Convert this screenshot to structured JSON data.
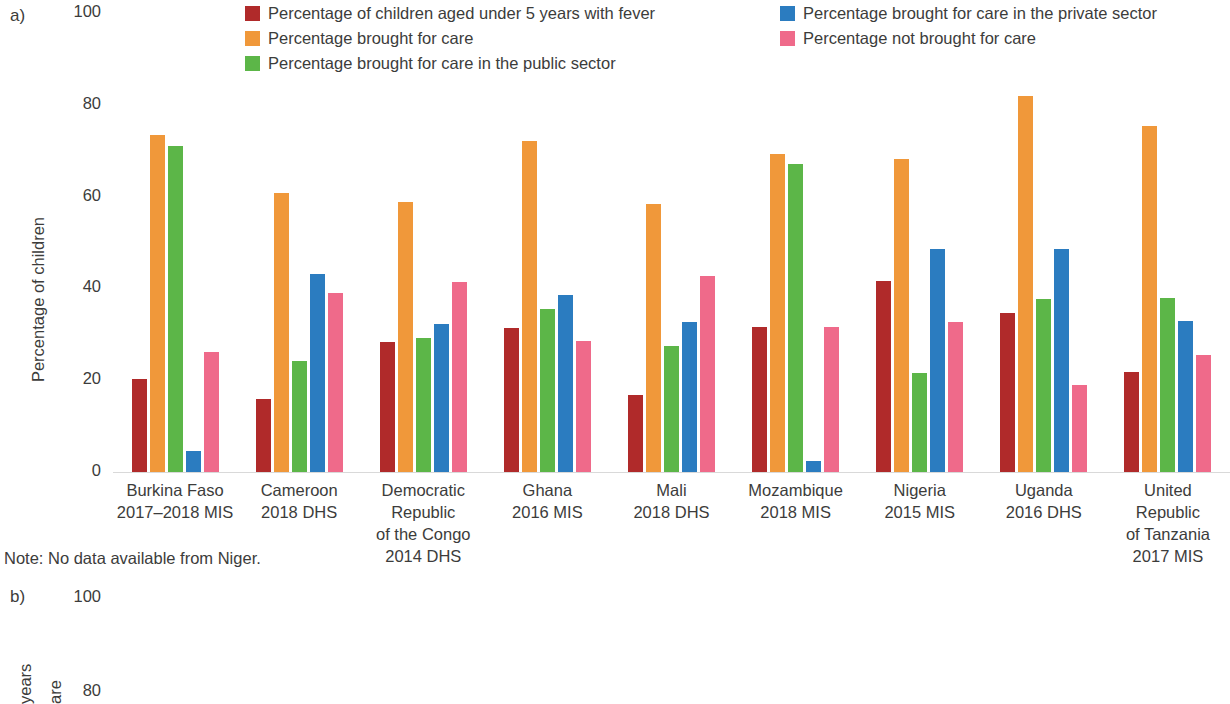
{
  "panels": {
    "a": {
      "letter": "a)",
      "note": "Note: No data available from Niger."
    },
    "b": {
      "letter": "b)"
    }
  },
  "legend": {
    "items": [
      {
        "label": "Percentage of children aged under 5 years with fever",
        "color": "#b02a2a",
        "name": "legend-fever"
      },
      {
        "label": "Percentage brought for care in the private sector",
        "color": "#2b7cc0",
        "name": "legend-private"
      },
      {
        "label": "Percentage brought for care",
        "color": "#f0983a",
        "name": "legend-care"
      },
      {
        "label": "Percentage not brought for care",
        "color": "#ef6a8a",
        "name": "legend-not-care"
      },
      {
        "label": "Percentage brought for care in the public sector",
        "color": "#5cb648",
        "name": "legend-public"
      }
    ]
  },
  "chart_data": {
    "type": "bar",
    "title": "",
    "xlabel": "",
    "ylabel": "Percentage of children",
    "ylim": [
      0,
      100
    ],
    "yticks": [
      "0",
      "20",
      "40",
      "60",
      "80",
      "100"
    ],
    "grid": false,
    "legend_position": "top",
    "categories": [
      "Burkina Faso\n2017–2018 MIS",
      "Cameroon\n2018 DHS",
      "Democratic\nRepublic\nof the Congo\n2014 DHS",
      "Ghana\n2016 MIS",
      "Mali\n2018 DHS",
      "Mozambique\n2018 MIS",
      "Nigeria\n2015 MIS",
      "Uganda\n2016 DHS",
      "United\nRepublic\nof Tanzania\n2017 MIS"
    ],
    "series": [
      {
        "name": "Percentage of children aged under 5 years with fever",
        "color": "#b02a2a",
        "values": [
          20.3,
          15.8,
          28.3,
          31.3,
          16.8,
          31.5,
          41.7,
          34.6,
          21.8
        ]
      },
      {
        "name": "Percentage brought for care",
        "color": "#f0983a",
        "values": [
          73.4,
          60.8,
          58.9,
          72.2,
          58.3,
          69.2,
          68.2,
          82.0,
          75.3
        ]
      },
      {
        "name": "Percentage brought for care in the public sector",
        "color": "#5cb648",
        "values": [
          71.1,
          24.2,
          29.2,
          35.5,
          27.4,
          67.0,
          21.6,
          37.8,
          37.9
        ]
      },
      {
        "name": "Percentage brought for care in the private sector",
        "color": "#2b7cc0",
        "values": [
          4.6,
          43.2,
          32.3,
          38.5,
          32.6,
          2.5,
          48.6,
          48.6,
          32.9
        ]
      },
      {
        "name": "Percentage not brought for care",
        "color": "#ef6a8a",
        "values": [
          26.2,
          39.1,
          41.4,
          28.5,
          42.6,
          31.5,
          32.7,
          19.0,
          25.6
        ]
      }
    ]
  },
  "panel_b_chart": {
    "type": "bar",
    "yticks": [
      "100",
      "80"
    ],
    "ylabel_words": [
      "years",
      "are"
    ]
  }
}
